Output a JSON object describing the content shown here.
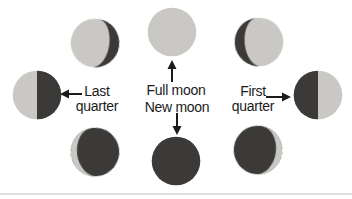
{
  "figure": {
    "background": "#ffffff",
    "colors": {
      "lit": "#c9c8c4",
      "shadow": "#3b3a38",
      "ink": "#1b1b1b",
      "rule": "#e0e0e0"
    },
    "labels": {
      "full_moon": "Full moon",
      "new_moon": "New moon",
      "last_quarter": {
        "line1": "Last",
        "line2": "quarter"
      },
      "first_quarter": {
        "line1": "First",
        "line2": "quarter"
      }
    },
    "moons": [
      {
        "name": "waning-gibbous-moon",
        "phase": "waning gibbous"
      },
      {
        "name": "full-moon",
        "phase": "full"
      },
      {
        "name": "waxing-gibbous-moon",
        "phase": "waxing gibbous"
      },
      {
        "name": "last-quarter-moon",
        "phase": "last quarter"
      },
      {
        "name": "first-quarter-moon",
        "phase": "first quarter"
      },
      {
        "name": "waning-crescent-moon",
        "phase": "waning crescent"
      },
      {
        "name": "new-moon",
        "phase": "new"
      },
      {
        "name": "waxing-crescent-moon",
        "phase": "waxing crescent"
      }
    ],
    "icons": {
      "arrow_up": "arrow-up-icon",
      "arrow_down": "arrow-down-icon",
      "arrow_left": "arrow-left-icon",
      "arrow_right": "arrow-right-icon"
    }
  }
}
